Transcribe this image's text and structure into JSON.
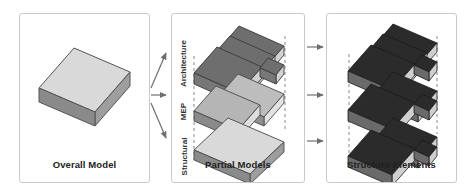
{
  "diagram": {
    "panels": [
      {
        "id": "overall",
        "caption": "Overall Model"
      },
      {
        "id": "partial",
        "caption": "Partial Models"
      },
      {
        "id": "structure",
        "caption": "Structure Elements"
      }
    ],
    "layer_labels": [
      {
        "id": "architecture",
        "text": "Architecture"
      },
      {
        "id": "mep",
        "text": "MEP"
      },
      {
        "id": "structural",
        "text": "Structural"
      }
    ],
    "arrows": {
      "left_group": [
        "arrow-to-architecture",
        "arrow-to-mep",
        "arrow-to-structural"
      ],
      "right_group": [
        "arrow-to-elements-top",
        "arrow-to-elements-middle",
        "arrow-to-elements-bottom"
      ]
    },
    "colors": {
      "panel_border": "#c9c9c9",
      "page_background": "#ffffff",
      "caption_text": "#222222",
      "label_text": "#333333",
      "arrow": "#6f6f6f",
      "dashed_guide": "#8a8a8a",
      "slab_light_top": "#d9d9d9",
      "slab_light_front": "#a8a8a8",
      "slab_light_side": "#7d7d7d",
      "slab_mid_top": "#b5b5b5",
      "slab_mid_front": "#8f8f8f",
      "slab_dark_top": "#6e6e6e",
      "slab_dark_front": "#d2d2d2",
      "slab_black_top": "#2b2b2b",
      "slab_black_front": "#cfcfcf",
      "slab_black_side": "#6a6a6a"
    }
  }
}
